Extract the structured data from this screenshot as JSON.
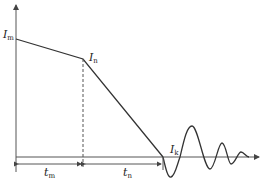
{
  "diagram": {
    "type": "current-waveform",
    "labels": {
      "Im": {
        "main": "I",
        "sub": "m"
      },
      "In": {
        "main": "I",
        "sub": "n"
      },
      "Ik": {
        "main": "I",
        "sub": "k"
      },
      "tm": {
        "main": "t",
        "sub": "m"
      },
      "tn": {
        "main": "t",
        "sub": "n"
      }
    },
    "points": {
      "Im": [
        16,
        39
      ],
      "In": [
        83,
        59
      ],
      "Ik": [
        163,
        157
      ]
    },
    "colors": {
      "line": "#333333",
      "axis": "#444444",
      "background": "#ffffff"
    }
  }
}
